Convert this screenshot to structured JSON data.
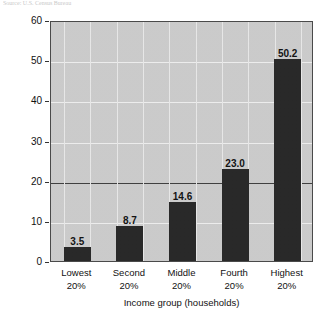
{
  "figure": {
    "source_note": "Source: U.S. Census Bureau"
  },
  "chart_data": {
    "type": "bar",
    "title": "",
    "subtitle": "",
    "categories": [
      "Lowest 20%",
      "Second 20%",
      "Middle 20%",
      "Fourth 20%",
      "Highest 20%"
    ],
    "category_lines": [
      [
        "Lowest",
        "20%"
      ],
      [
        "Second",
        "20%"
      ],
      [
        "Middle",
        "20%"
      ],
      [
        "Fourth",
        "20%"
      ],
      [
        "Highest",
        "20%"
      ]
    ],
    "values": [
      3.5,
      8.7,
      14.6,
      23.0,
      50.2
    ],
    "value_labels": [
      "3.5",
      "8.7",
      "14.6",
      "23.0",
      "50.2"
    ],
    "xlabel": "Income group (households)",
    "ylabel": "Personal income received (percent)",
    "ylim": [
      0,
      60
    ],
    "ytick_labels": [
      "0",
      "10",
      "20",
      "30",
      "40",
      "50",
      "60"
    ],
    "ytick_values": [
      0,
      10,
      20,
      30,
      40,
      50,
      60
    ],
    "emphasis_gridline": 20,
    "grid": true,
    "legend": null,
    "bar_color": "#242424",
    "plot_background": "#cdcdcd",
    "gridline_color": "#f0f0f0",
    "emphasis_line_color": "#3c3c3c"
  }
}
